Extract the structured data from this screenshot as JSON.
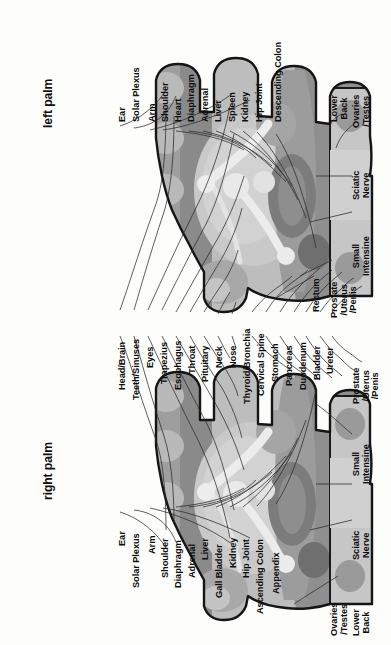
{
  "diagram": {
    "kind": "reflexology-hand-chart",
    "orientation": "rotated-90",
    "background_hex": "#fdfdfc",
    "ink_hex": "#111111",
    "palette": {
      "outline": "#1a1a1a",
      "tone_lightest": "#e7e7e7",
      "tone_light": "#c9c9c9",
      "tone_mid": "#b0b0b0",
      "tone_mid_dark": "#9a9a9a",
      "tone_dark": "#7d7d7d",
      "tone_darkest": "#5f5f5f",
      "highlight": "#efefef"
    }
  },
  "panels": [
    {
      "id": "left-palm",
      "title": "left palm",
      "labels_top": [
        "Ear",
        "Solar Plexus",
        "Arm",
        "Shoulder",
        "Heart",
        "Diaphragm",
        "Adrenal",
        "Liver",
        "Spleen",
        "Kidney",
        "Hip Joint",
        "Descending Colon"
      ],
      "labels_top_right": [
        "Ovaries\n/Testes",
        "Lower\nBack"
      ],
      "labels_right": [
        "Sciatic\nNerve",
        "Small\nIntensine"
      ],
      "labels_bottom_right": [
        "Rectum",
        "Prostate\n/Uterus\n/Penis"
      ],
      "labels_bottom": [
        "Head/Brain",
        "Teeth/Sinuses",
        "Eyes",
        "Trapezius",
        "Esophagus",
        "Throat",
        "Pituitary",
        "Neck",
        "Nose",
        "Thyroid/Bronchia",
        "Cervical Spine",
        "Stomach",
        "Pancreas",
        "Duodenum",
        "Bladder",
        "Ureter"
      ]
    },
    {
      "id": "right-palm",
      "title": "right palm",
      "labels_top": [
        "Head/Brain",
        "Teeth/Sinuses",
        "Eyes",
        "Trapezius",
        "Esophagus",
        "Throat",
        "Pituitary",
        "Neck",
        "Nose",
        "Thyroid/Bronchia",
        "Cervical Spine",
        "Stomach",
        "Pancreas",
        "Duodenum",
        "Bladder",
        "Ureter"
      ],
      "labels_top_right": [
        "Prostate\n/Uterus\n/Penis"
      ],
      "labels_right": [
        "Small\nIntensine",
        "Sciatic\nNerve",
        "Lower\nBack"
      ],
      "labels_bottom_right": [
        "Ovaries\n/Testes"
      ],
      "labels_bottom": [
        "Ear",
        "Solar Plexus",
        "Arm",
        "Shoulder",
        "Diaphragm",
        "Adrenal",
        "Liver",
        "Gall Bladder",
        "Kidney",
        "Hip Joint",
        "Ascending Colon",
        "Appendix"
      ]
    }
  ],
  "labels": {
    "ear": "Ear",
    "solar_plexus": "Solar Plexus",
    "arm": "Arm",
    "shoulder": "Shoulder",
    "heart": "Heart",
    "diaphragm": "Diaphragm",
    "adrenal": "Adrenal",
    "liver": "Liver",
    "spleen": "Spleen",
    "kidney": "Kidney",
    "hip_joint": "Hip Joint",
    "descending_colon": "Descending Colon",
    "ascending_colon": "Ascending Colon",
    "appendix": "Appendix",
    "gall_bladder": "Gall Bladder",
    "ovaries_testes_1": "Ovaries",
    "ovaries_testes_2": "/Testes",
    "lower_1": "Lower",
    "lower_2": "Back",
    "sciatic_1": "Sciatic",
    "sciatic_2": "Nerve",
    "small_1": "Small",
    "small_2": "Intensine",
    "rectum": "Rectum",
    "prostate_1": "Prostate",
    "prostate_2": "/Uterus",
    "prostate_3": "/Penis",
    "head_brain": "Head/Brain",
    "teeth_sinuses": "Teeth/Sinuses",
    "eyes": "Eyes",
    "trapezius": "Trapezius",
    "esophagus": "Esophagus",
    "throat": "Throat",
    "pituitary": "Pituitary",
    "neck": "Neck",
    "nose": "Nose",
    "thyroid_bronchia": "Thyroid/Bronchia",
    "cervical_spine": "Cervical Spine",
    "stomach": "Stomach",
    "pancreas": "Pancreas",
    "duodenum": "Duodenum",
    "bladder": "Bladder",
    "ureter": "Ureter",
    "left_palm": "left palm",
    "right_palm": "right palm"
  }
}
